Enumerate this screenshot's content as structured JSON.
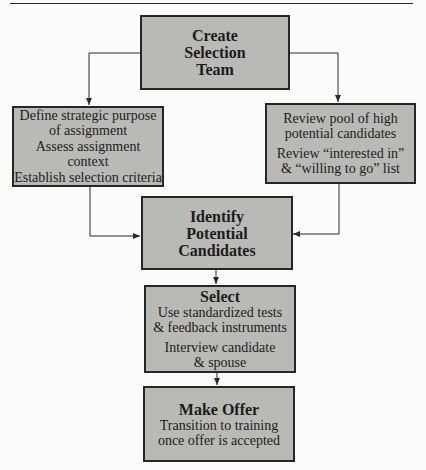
{
  "figure": {
    "nodes": {
      "create_team": {
        "title": "Create\nSelection\nTeam"
      },
      "strategic": {
        "items": [
          "Define strategic purpose\nof assignment",
          "Assess assignment context",
          "Establish selection criteria"
        ]
      },
      "pool": {
        "items": [
          "Review pool of high\npotential candidates",
          "Review “interested in”\n& “willing to go” list"
        ]
      },
      "identify": {
        "title": "Identify\nPotential\nCandidates"
      },
      "select": {
        "title": "Select",
        "items": [
          "Use standardized tests\n& feedback instruments",
          "Interview candidate\n& spouse"
        ]
      },
      "offer": {
        "title": "Make Offer",
        "items": [
          "Transition to training\nonce offer is accepted"
        ]
      }
    },
    "edges": [
      {
        "from": "create_team",
        "to": "strategic"
      },
      {
        "from": "create_team",
        "to": "pool"
      },
      {
        "from": "strategic",
        "to": "identify"
      },
      {
        "from": "pool",
        "to": "identify"
      },
      {
        "from": "identify",
        "to": "select"
      },
      {
        "from": "select",
        "to": "offer"
      }
    ],
    "colors": {
      "box_fill": "#b9b9b6",
      "box_border": "#262626",
      "background": "#fbfbfa"
    }
  }
}
